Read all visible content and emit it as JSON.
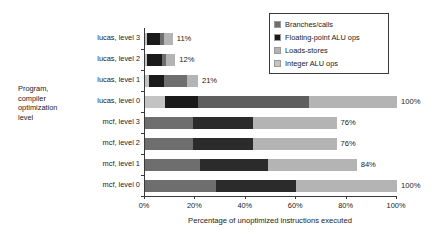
{
  "chart_data": {
    "type": "bar",
    "orientation": "horizontal",
    "stacked": true,
    "title": "",
    "xlabel": "Percentage of unoptimized instructions executed",
    "ylabel": "Program,\ncompiler\noptimization\nlevel",
    "xlim": [
      0,
      100
    ],
    "xticks": [
      0,
      20,
      40,
      60,
      80,
      100
    ],
    "xticklabels": [
      "0%",
      "20%",
      "40%",
      "60%",
      "80%",
      "100%"
    ],
    "grid": false,
    "legend_position": "top-right",
    "categories": [
      "lucas, level 3",
      "lucas, level 2",
      "lucas, level 1",
      "lucas, level 0",
      "mcf, level 3",
      "mcf, level 2",
      "mcf, level 1",
      "mcf, level 0"
    ],
    "series": [
      {
        "name": "Integer ALU ops",
        "color": "#c3c3c3",
        "values": [
          0.8,
          0.9,
          1.6,
          8.0,
          0,
          0,
          0,
          0
        ]
      },
      {
        "name": "Floating-point ALU ops",
        "color": "#1a1a1a",
        "values": [
          5.2,
          5.8,
          6.0,
          13.0,
          0,
          0,
          0,
          0
        ]
      },
      {
        "name": "Branches/calls",
        "color": "#6e6e6e",
        "values": [
          1.5,
          1.6,
          9.0,
          44.0,
          19.0,
          19.0,
          22.0,
          28.0
        ]
      },
      {
        "name": "Floating-point ALU ops (2)",
        "color": "#2b2b2b",
        "values": [
          0,
          0,
          0,
          0,
          24.0,
          24.0,
          27.0,
          32.0
        ]
      },
      {
        "name": "Loads-stores",
        "color": "#b4b4b4",
        "values": [
          3.5,
          3.7,
          4.4,
          35.0,
          33.0,
          33.0,
          35.0,
          40.0
        ]
      }
    ],
    "bars": [
      {
        "category": "lucas, level 3",
        "total_label": "11%",
        "total": 11,
        "segments": [
          {
            "series": "Integer ALU ops",
            "start": 0,
            "end": 0.8,
            "color": "#c3c3c3"
          },
          {
            "series": "Floating-point ALU ops",
            "start": 0.8,
            "end": 6.0,
            "color": "#1a1a1a"
          },
          {
            "series": "Branches/calls",
            "start": 6.0,
            "end": 7.5,
            "color": "#6e6e6e"
          },
          {
            "series": "Loads-stores",
            "start": 7.5,
            "end": 11.0,
            "color": "#b4b4b4"
          }
        ]
      },
      {
        "category": "lucas, level 2",
        "total_label": "12%",
        "total": 12,
        "segments": [
          {
            "series": "Integer ALU ops",
            "start": 0,
            "end": 0.9,
            "color": "#c3c3c3"
          },
          {
            "series": "Floating-point ALU ops",
            "start": 0.9,
            "end": 6.7,
            "color": "#1a1a1a"
          },
          {
            "series": "Branches/calls",
            "start": 6.7,
            "end": 8.3,
            "color": "#6e6e6e"
          },
          {
            "series": "Loads-stores",
            "start": 8.3,
            "end": 12.0,
            "color": "#b4b4b4"
          }
        ]
      },
      {
        "category": "lucas, level 1",
        "total_label": "21%",
        "total": 21,
        "segments": [
          {
            "series": "Integer ALU ops",
            "start": 0,
            "end": 1.6,
            "color": "#c3c3c3"
          },
          {
            "series": "Floating-point ALU ops",
            "start": 1.6,
            "end": 7.6,
            "color": "#1a1a1a"
          },
          {
            "series": "Branches/calls",
            "start": 7.6,
            "end": 16.6,
            "color": "#6e6e6e"
          },
          {
            "series": "Loads-stores",
            "start": 16.6,
            "end": 21.0,
            "color": "#b4b4b4"
          }
        ]
      },
      {
        "category": "lucas, level 0",
        "total_label": "100%",
        "total": 100,
        "segments": [
          {
            "series": "Integer ALU ops",
            "start": 0,
            "end": 8.0,
            "color": "#c3c3c3"
          },
          {
            "series": "Floating-point ALU ops",
            "start": 8.0,
            "end": 21.0,
            "color": "#1a1a1a"
          },
          {
            "series": "Branches/calls",
            "start": 21.0,
            "end": 65.0,
            "color": "#5e5e5e"
          },
          {
            "series": "Loads-stores",
            "start": 65.0,
            "end": 100.0,
            "color": "#b4b4b4"
          }
        ]
      },
      {
        "category": "mcf, level 3",
        "total_label": "76%",
        "total": 76,
        "segments": [
          {
            "series": "Branches/calls",
            "start": 0,
            "end": 19.0,
            "color": "#6e6e6e"
          },
          {
            "series": "Floating-point ALU ops",
            "start": 19.0,
            "end": 43.0,
            "color": "#2b2b2b"
          },
          {
            "series": "Loads-stores",
            "start": 43.0,
            "end": 76.0,
            "color": "#b4b4b4"
          }
        ]
      },
      {
        "category": "mcf, level 2",
        "total_label": "76%",
        "total": 76,
        "segments": [
          {
            "series": "Branches/calls",
            "start": 0,
            "end": 19.0,
            "color": "#6e6e6e"
          },
          {
            "series": "Floating-point ALU ops",
            "start": 19.0,
            "end": 43.0,
            "color": "#2b2b2b"
          },
          {
            "series": "Loads-stores",
            "start": 43.0,
            "end": 76.0,
            "color": "#b4b4b4"
          }
        ]
      },
      {
        "category": "mcf, level 1",
        "total_label": "84%",
        "total": 84,
        "segments": [
          {
            "series": "Branches/calls",
            "start": 0,
            "end": 22.0,
            "color": "#6e6e6e"
          },
          {
            "series": "Floating-point ALU ops",
            "start": 22.0,
            "end": 49.0,
            "color": "#2b2b2b"
          },
          {
            "series": "Loads-stores",
            "start": 49.0,
            "end": 84.0,
            "color": "#b4b4b4"
          }
        ]
      },
      {
        "category": "mcf, level 0",
        "total_label": "100%",
        "total": 100,
        "segments": [
          {
            "series": "Branches/calls",
            "start": 0,
            "end": 28.0,
            "color": "#6e6e6e"
          },
          {
            "series": "Floating-point ALU ops",
            "start": 28.0,
            "end": 60.0,
            "color": "#2b2b2b"
          },
          {
            "series": "Loads-stores",
            "start": 60.0,
            "end": 100.0,
            "color": "#b4b4b4"
          }
        ]
      }
    ],
    "legend": [
      {
        "label": "Branches/calls",
        "color": "#6e6e6e"
      },
      {
        "label": "Floating-point ALU ops",
        "color": "#1a1a1a"
      },
      {
        "label": "Loads-stores",
        "color": "#b4b4b4"
      },
      {
        "label": "Integer ALU ops",
        "color": "#c3c3c3"
      }
    ]
  }
}
